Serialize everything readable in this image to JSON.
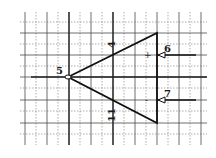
{
  "diagram": {
    "grid": {
      "solid_color": "#4a4a4a",
      "dashed_color": "#8a8a8a",
      "solid_x": [
        25,
        47,
        69,
        91,
        113,
        135,
        157,
        179,
        201
      ],
      "dashed_x": [
        36,
        58,
        80,
        102,
        124,
        146,
        168,
        190
      ],
      "solid_y": [
        33,
        55,
        77,
        100,
        123
      ],
      "dashed_y": [
        22,
        44,
        66,
        88,
        111,
        134
      ],
      "x_range": [
        20,
        207
      ],
      "y_range": [
        12,
        145
      ]
    },
    "triangle": {
      "apex": [
        68,
        77
      ],
      "top_right": [
        157,
        33
      ],
      "bottom_right": [
        157,
        123
      ],
      "stroke": "#111111"
    },
    "pins": [
      {
        "id": "pin-5",
        "label": "5",
        "role": "output",
        "label_pos": [
          58,
          73
        ]
      },
      {
        "id": "pin-4",
        "label": "4",
        "role": "supply-top",
        "label_pos": [
          111,
          47
        ]
      },
      {
        "id": "pin-6",
        "label": "6",
        "role": "non-inverting-input",
        "label_pos": [
          166,
          52
        ]
      },
      {
        "id": "pin-7",
        "label": "7",
        "role": "inverting-input",
        "label_pos": [
          166,
          97
        ]
      },
      {
        "id": "pin-11",
        "label": "11",
        "role": "supply-bottom",
        "label_pos": [
          111,
          115
        ]
      }
    ],
    "signs": {
      "plus": "+",
      "minus": "-"
    }
  }
}
